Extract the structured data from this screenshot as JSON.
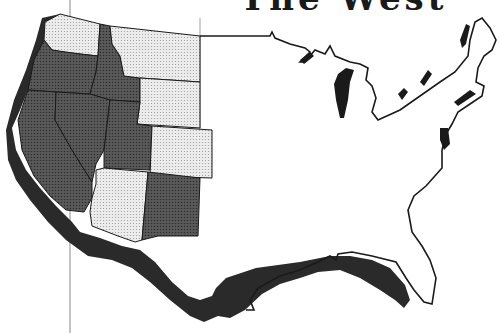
{
  "map": {
    "title": "The West",
    "legend": {
      "dark_pattern": "dark-stippled",
      "light_pattern": "light-stippled"
    },
    "colors": {
      "outline": "#1a1a1a",
      "dark_fill": "#4a4a4a",
      "light_fill": "#e2e2e2",
      "coast_shadow": "#2a2a2a",
      "background": "#ffffff"
    },
    "regions": {
      "dark": [
        "Oregon",
        "Idaho",
        "California",
        "Nevada",
        "Utah",
        "New Mexico"
      ],
      "light": [
        "Washington",
        "Montana",
        "Wyoming",
        "Colorado",
        "Arizona"
      ]
    }
  }
}
